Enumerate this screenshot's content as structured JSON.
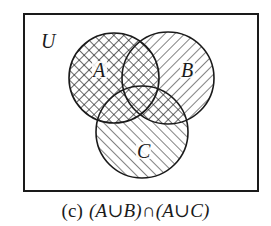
{
  "figure": {
    "universe_label": "U",
    "sets": [
      {
        "label": "A",
        "cx": 114,
        "cy": 78,
        "r": 45,
        "fill": "crosshatch"
      },
      {
        "label": "B",
        "cx": 168,
        "cy": 78,
        "r": 46,
        "fill": "hatch-backslash"
      },
      {
        "label": "C",
        "cx": 142,
        "cy": 132,
        "r": 46,
        "fill": "hatch-slash"
      }
    ],
    "shaded_expression": "(A∪B)∩(A∪C)",
    "caption": {
      "tag": "(c)",
      "expression": "(A∪B)∩(A∪C)"
    },
    "colors": {
      "ink": "#1a1a1a",
      "background": "#ffffff"
    }
  }
}
